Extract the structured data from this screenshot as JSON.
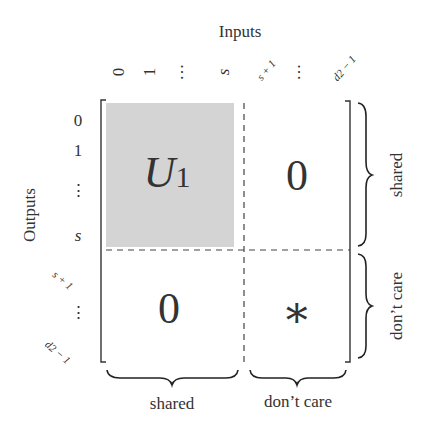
{
  "diagram": {
    "inputs_label": "Inputs",
    "outputs_label": "Outputs",
    "column_ticks": {
      "c0": "0",
      "c1": "1",
      "c_dots1": "···",
      "c_s": "s",
      "c_s1": "s + 1",
      "c_dots2": "···",
      "c_d2": "d2 − 1"
    },
    "row_ticks": {
      "r0": "0",
      "r1": "1",
      "r_dots1": "⋮",
      "r_s": "s",
      "r_s1": "s + 1",
      "r_dots2": "⋮",
      "r_d2": "d2 − 1"
    },
    "blocks": {
      "top_left": {
        "main": "U",
        "sub": "1",
        "fill": "#d4d4d4"
      },
      "top_right": "0",
      "bottom_left": "0",
      "bottom_right": "∗"
    },
    "braces": {
      "right_top": "shared",
      "right_bottom": "don’t care",
      "bottom_left": "shared",
      "bottom_right": "don’t care"
    }
  }
}
